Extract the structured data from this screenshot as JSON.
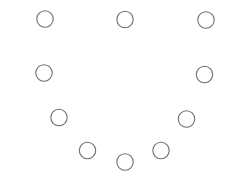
{
  "diagram": {
    "background": "#ffffff",
    "stroke_color": "#6e6e6e",
    "stroke_width": 1.1,
    "fill": "#ffffff",
    "circles": [
      {
        "cx": 45,
        "cy": 19,
        "r": 8.2
      },
      {
        "cx": 125,
        "cy": 19.5,
        "r": 8.2
      },
      {
        "cx": 206,
        "cy": 20,
        "r": 8.2
      },
      {
        "cx": 44,
        "cy": 73,
        "r": 8.2
      },
      {
        "cx": 204.5,
        "cy": 74.5,
        "r": 8.2
      },
      {
        "cx": 59,
        "cy": 117.5,
        "r": 8.2
      },
      {
        "cx": 186.5,
        "cy": 119,
        "r": 8.2
      },
      {
        "cx": 87.5,
        "cy": 150.5,
        "r": 8.2
      },
      {
        "cx": 125,
        "cy": 162,
        "r": 8.2
      },
      {
        "cx": 161,
        "cy": 150.5,
        "r": 8.2
      }
    ]
  }
}
